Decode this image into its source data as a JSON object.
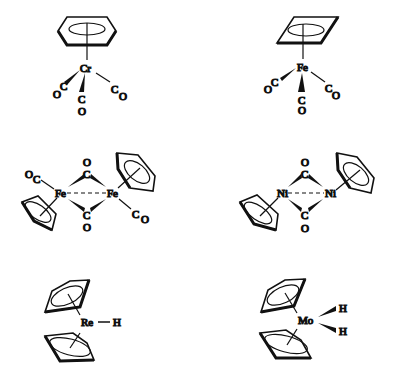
{
  "figure": {
    "background": "#ffffff",
    "ink": "#111111"
  },
  "structures": [
    {
      "id": "benzene-chromium-tricarbonyl",
      "metal": "Cr",
      "ligands": [
        "C6H6 (benzene ring)",
        "CO",
        "CO",
        "CO"
      ],
      "labels": {
        "metal": "Cr",
        "c1": "C",
        "o1": "O",
        "c2": "C",
        "o2": "O",
        "c3": "C",
        "o3": "O"
      }
    },
    {
      "id": "cyclobutadiene-iron-tricarbonyl",
      "metal": "Fe",
      "ligands": [
        "C4H4 (cyclobutadiene ring)",
        "CO",
        "CO",
        "CO"
      ],
      "labels": {
        "metal": "Fe",
        "c1": "C",
        "o1": "O",
        "c2": "C",
        "o2": "O",
        "c3": "C",
        "o3": "O"
      }
    },
    {
      "id": "cyclopentadienyl-iron-dicarbonyl-dimer",
      "metal": "Fe",
      "ligands": [
        "Cp",
        "Cp",
        "terminal CO",
        "terminal CO",
        "bridging CO",
        "bridging CO"
      ],
      "labels": {
        "metal1": "Fe",
        "metal2": "Fe",
        "tc1": "C",
        "to1": "O",
        "tc2": "C",
        "to2": "O",
        "bc1": "C",
        "bo1": "O",
        "bc2": "C",
        "bo2": "O"
      }
    },
    {
      "id": "cyclopentadienyl-nickel-carbonyl-dimer",
      "metal": "Ni",
      "ligands": [
        "Cp",
        "Cp",
        "bridging CO",
        "bridging CO"
      ],
      "labels": {
        "metal1": "Ni",
        "metal2": "Ni",
        "bc1": "C",
        "bo1": "O",
        "bc2": "C",
        "bo2": "O"
      }
    },
    {
      "id": "bis-cyclopentadienyl-rhenium-hydride",
      "metal": "Re",
      "ligands": [
        "Cp",
        "Cp",
        "H"
      ],
      "labels": {
        "metal": "Re",
        "h1": "H"
      }
    },
    {
      "id": "bis-cyclopentadienyl-molybdenum-dihydride",
      "metal": "Mo",
      "ligands": [
        "Cp",
        "Cp",
        "H",
        "H"
      ],
      "labels": {
        "metal": "Mo",
        "h1": "H",
        "h2": "H"
      }
    }
  ]
}
